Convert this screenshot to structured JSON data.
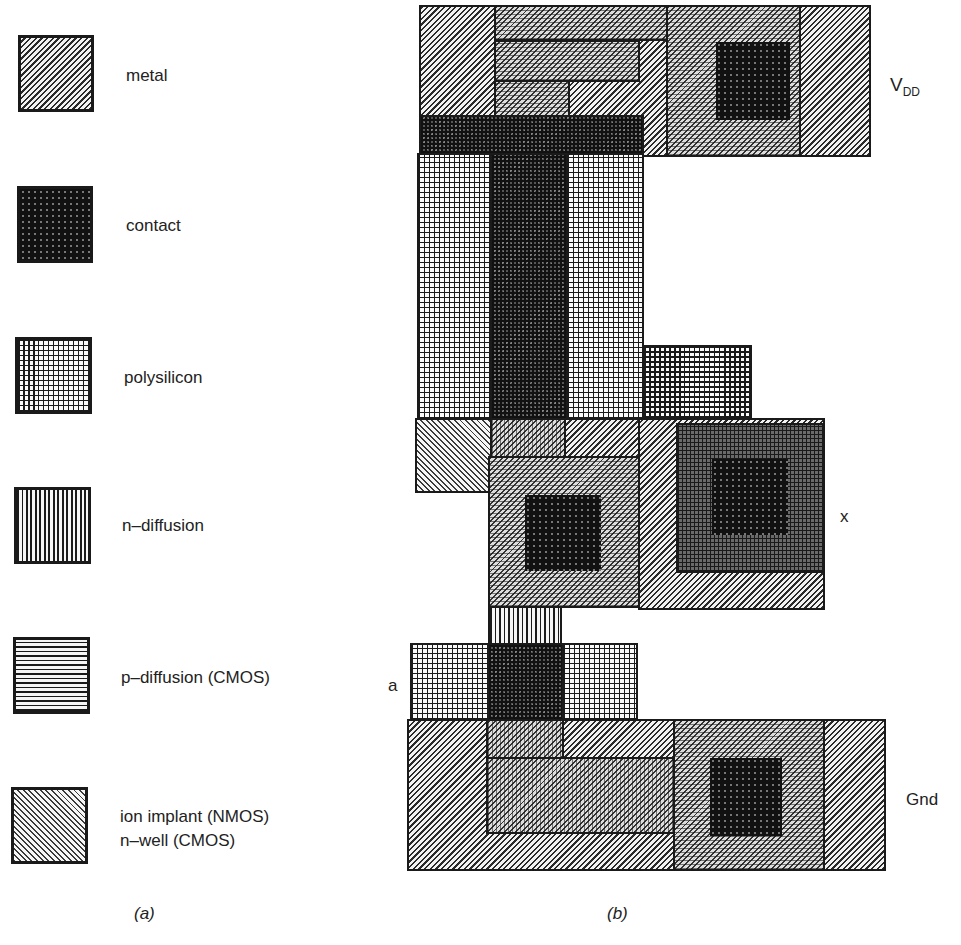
{
  "legend": {
    "panel_label": "(a)",
    "items": [
      {
        "name": "metal",
        "label": "metal",
        "pattern": "diagonal-hatch-right"
      },
      {
        "name": "contact",
        "label": "contact",
        "pattern": "dense-dark-dots"
      },
      {
        "name": "polysilicon",
        "label": "polysilicon",
        "pattern": "grid"
      },
      {
        "name": "n-diffusion",
        "label": "n–diffusion",
        "pattern": "vertical-wavy-lines"
      },
      {
        "name": "p-diffusion",
        "label": "p–diffusion (CMOS)",
        "pattern": "horizontal-wavy-lines"
      },
      {
        "name": "implant",
        "label_line1": "ion implant (NMOS)",
        "label_line2": "n–well (CMOS)",
        "pattern": "diagonal-hatch-left"
      }
    ]
  },
  "layout": {
    "panel_label": "(b)",
    "nodes": {
      "vdd_main": "V",
      "vdd_sub": "DD",
      "input": "a",
      "output": "x",
      "ground": "Gnd"
    }
  },
  "colors": {
    "ink": "#1a1a1a",
    "paper": "#ffffff",
    "contact": "#111111"
  }
}
